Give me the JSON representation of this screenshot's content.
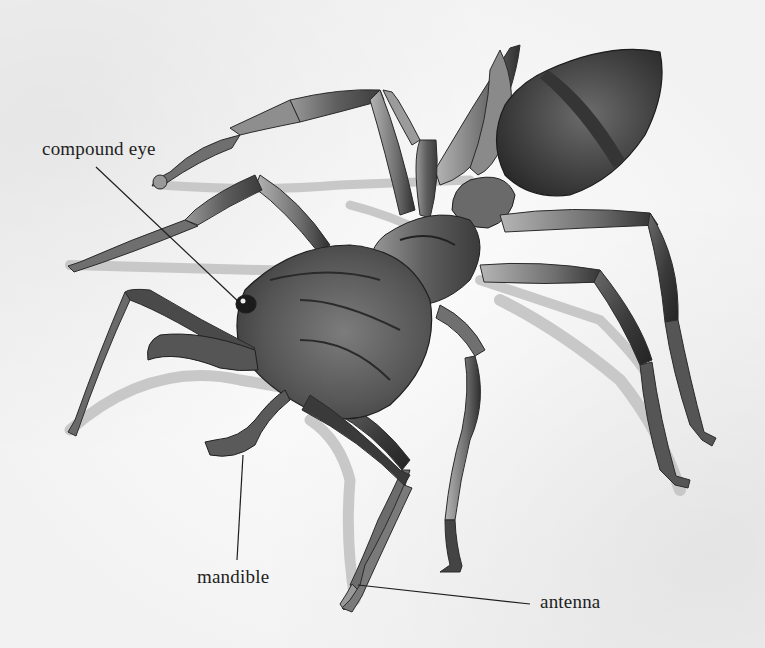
{
  "figure": {
    "style": "grayscale watercolor",
    "background_color": "#f7f7f7",
    "ink_color": "#1e1e1e"
  },
  "labels": [
    {
      "id": "compound-eye",
      "text": "compound eye",
      "x": 42,
      "y": 138,
      "line": [
        [
          96,
          167
        ],
        [
          241,
          304
        ]
      ]
    },
    {
      "id": "mandible",
      "text": "mandible",
      "x": 197,
      "y": 566,
      "line": [
        [
          237,
          560
        ],
        [
          243,
          455
        ]
      ]
    },
    {
      "id": "antenna",
      "text": "antenna",
      "x": 540,
      "y": 591,
      "line": [
        [
          530,
          604
        ],
        [
          358,
          585
        ]
      ]
    }
  ]
}
